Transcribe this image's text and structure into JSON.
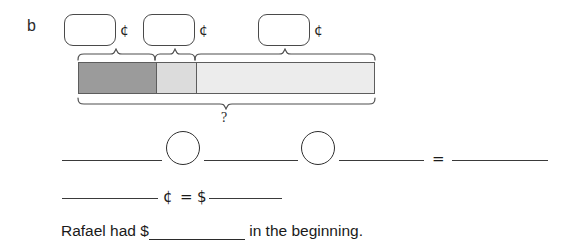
{
  "worksheet": {
    "part_label": "b",
    "background_color": "#ffffff",
    "ink_color": "#1a1a1a"
  },
  "value_boxes": [
    {
      "name": "box-1",
      "value": "",
      "unit": "¢",
      "x": 64,
      "y": 14,
      "width": 52,
      "height": 32
    },
    {
      "name": "box-2",
      "value": "",
      "unit": "¢",
      "x": 143,
      "y": 14,
      "width": 52,
      "height": 32
    },
    {
      "name": "box-3",
      "value": "",
      "unit": "¢",
      "x": 258,
      "y": 14,
      "width": 52,
      "height": 32
    }
  ],
  "bar_model": {
    "x": 78,
    "y": 62,
    "width": 297,
    "height": 32,
    "border_color": "#5d5d5d",
    "segments": [
      {
        "name": "segment-1",
        "label": "",
        "width_px": 77,
        "color": "#9b9b9b"
      },
      {
        "name": "segment-2",
        "label": "",
        "width_px": 40,
        "color": "#dcdcdc"
      },
      {
        "name": "segment-3",
        "label": "",
        "width_px": 180,
        "color": "#ececec"
      }
    ],
    "top_braces": [
      {
        "name": "top-brace-1",
        "from_x": 78,
        "to_x": 155
      },
      {
        "name": "top-brace-2",
        "from_x": 155,
        "to_x": 195
      },
      {
        "name": "top-brace-3",
        "from_x": 195,
        "to_x": 375
      }
    ],
    "bottom_brace": {
      "name": "total-brace",
      "from_x": 78,
      "to_x": 375
    },
    "unknown_label": "?"
  },
  "work_lines": {
    "equation_row": {
      "blank_1": "",
      "operator_circle_1": "",
      "blank_2": "",
      "operator_circle_2": "",
      "blank_3": "",
      "equals": "=",
      "blank_result": ""
    },
    "conversion_row": {
      "blank_cents": "",
      "cent_symbol": "¢",
      "equals": "=",
      "dollar_symbol": "$",
      "blank_dollars": ""
    }
  },
  "answer_sentence": {
    "text_before": "Rafael had $",
    "blank": "",
    "text_after": " in the beginning."
  }
}
